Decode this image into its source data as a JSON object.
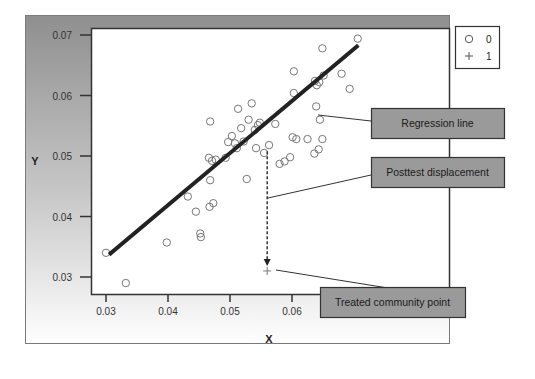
{
  "chart_data": {
    "type": "scatter",
    "title": "",
    "xlabel": "X",
    "ylabel": "Y",
    "xlim": [
      0.0275,
      0.0735
    ],
    "ylim": [
      0.0285,
      0.0715
    ],
    "xticks": [
      "0.03",
      "0.04",
      "0.05",
      "0.06"
    ],
    "yticks": [
      "0.03",
      "0.04",
      "0.05",
      "0.06",
      "0.07"
    ],
    "grid": false,
    "legend_position": "top-right outside",
    "legend": [
      {
        "marker": "circle",
        "label": "0"
      },
      {
        "marker": "plus",
        "label": "1"
      }
    ],
    "series": [
      {
        "name": "0",
        "marker": "circle",
        "points": [
          [
            0.03,
            0.034
          ],
          [
            0.0332,
            0.029
          ],
          [
            0.0398,
            0.0357
          ],
          [
            0.0432,
            0.0433
          ],
          [
            0.0445,
            0.0408
          ],
          [
            0.0452,
            0.0372
          ],
          [
            0.0453,
            0.0366
          ],
          [
            0.0467,
            0.0416
          ],
          [
            0.0473,
            0.0422
          ],
          [
            0.0466,
            0.0497
          ],
          [
            0.0471,
            0.0492
          ],
          [
            0.0477,
            0.0494
          ],
          [
            0.0468,
            0.046
          ],
          [
            0.0468,
            0.0557
          ],
          [
            0.0493,
            0.0497
          ],
          [
            0.0497,
            0.0523
          ],
          [
            0.0503,
            0.0533
          ],
          [
            0.0508,
            0.0521
          ],
          [
            0.0511,
            0.0513
          ],
          [
            0.0513,
            0.0578
          ],
          [
            0.0518,
            0.0546
          ],
          [
            0.0522,
            0.0524
          ],
          [
            0.0527,
            0.0462
          ],
          [
            0.053,
            0.056
          ],
          [
            0.0535,
            0.0587
          ],
          [
            0.054,
            0.0543
          ],
          [
            0.0542,
            0.0513
          ],
          [
            0.0545,
            0.0551
          ],
          [
            0.0548,
            0.0555
          ],
          [
            0.0555,
            0.0505
          ],
          [
            0.0563,
            0.0518
          ],
          [
            0.0573,
            0.0553
          ],
          [
            0.058,
            0.0487
          ],
          [
            0.0588,
            0.0491
          ],
          [
            0.0597,
            0.0498
          ],
          [
            0.0601,
            0.0531
          ],
          [
            0.0607,
            0.0528
          ],
          [
            0.0603,
            0.0604
          ],
          [
            0.0603,
            0.064
          ],
          [
            0.0637,
            0.0624
          ],
          [
            0.064,
            0.0617
          ],
          [
            0.0644,
            0.0622
          ],
          [
            0.0649,
            0.0678
          ],
          [
            0.0651,
            0.0633
          ],
          [
            0.0636,
            0.0504
          ],
          [
            0.0643,
            0.0511
          ],
          [
            0.0649,
            0.0528
          ],
          [
            0.0645,
            0.056
          ],
          [
            0.0639,
            0.0582
          ],
          [
            0.0706,
            0.0694
          ],
          [
            0.0693,
            0.0611
          ],
          [
            0.068,
            0.0636
          ],
          [
            0.0625,
            0.0528
          ]
        ]
      },
      {
        "name": "1",
        "marker": "plus",
        "points": [
          [
            0.056,
            0.031
          ]
        ]
      }
    ],
    "regression_line": {
      "from": [
        0.0305,
        0.0337
      ],
      "to": [
        0.0707,
        0.0683
      ]
    },
    "displacement": {
      "x": 0.056,
      "from_y": 0.0508,
      "to_y": 0.0318
    },
    "annotations": [
      {
        "text": "Regression line"
      },
      {
        "text": "Posttest displacement"
      },
      {
        "text": "Treated community point"
      }
    ]
  }
}
